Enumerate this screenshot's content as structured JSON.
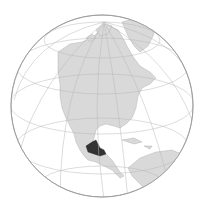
{
  "map": {
    "title": "Orthographic globe centered on North America",
    "projection": "orthographic",
    "highlighted_region": "Southern Mexico region",
    "colors": {
      "ocean": "#ffffff",
      "land": "#d9d9d9",
      "coast": "#aaaaaa",
      "graticule": "#b8b8b8",
      "highlight": "#333333",
      "outline": "#999999"
    },
    "visible_landmasses": [
      "North America",
      "Greenland",
      "Central America",
      "Caribbean",
      "South America (north)"
    ]
  }
}
